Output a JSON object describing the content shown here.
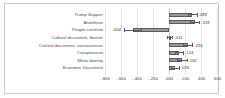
{
  "chart_data": {
    "type": "bar",
    "orientation": "horizontal",
    "title": "",
    "xlabel": "",
    "ylabel": "",
    "xlim": [
      -0.8,
      0.6
    ],
    "grid": true,
    "legend": "none",
    "zero_line": 0.0,
    "categories": [
      "Trump Support",
      "Antielitism",
      "People-centrism",
      "Cultural discontent, liberals",
      "Cultural discontent, conservatives",
      "Conspiracism",
      "White Identity",
      "Economic Discontent"
    ],
    "values": [
      0.288,
      0.319,
      -0.454,
      0.011,
      0.234,
      0.124,
      0.162,
      0.076
    ],
    "value_labels": [
      ".288",
      ".319",
      "-.454",
      ".011",
      ".234",
      ".124",
      ".162",
      ".076"
    ],
    "error_low": [
      0.232,
      0.258,
      -0.56,
      -0.02,
      0.178,
      0.072,
      0.104,
      0.03
    ],
    "error_high": [
      0.344,
      0.38,
      -0.348,
      0.042,
      0.29,
      0.176,
      0.22,
      0.122
    ],
    "tick_values": [
      -0.8,
      -0.6,
      -0.4,
      -0.2,
      0.0,
      0.2,
      0.4,
      0.6
    ],
    "tick_labels": [
      "-.800",
      "-.600",
      "-.400",
      "-.200",
      ".000",
      ".200",
      ".400",
      ".600"
    ]
  },
  "colors": {
    "bar_fill": "#9a9a9a",
    "bar_edge": "#5a5a5a",
    "grid": "#e2e2e2",
    "frame": "#c9c9c9",
    "text": "#3a3a3a"
  }
}
